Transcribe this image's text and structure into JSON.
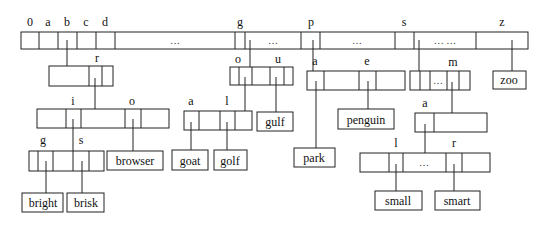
{
  "root": {
    "labels": [
      "0",
      "a",
      "b",
      "c",
      "d",
      "g",
      "p",
      "s",
      "z"
    ],
    "ellipses": [
      "…",
      "…",
      "…",
      "… …"
    ]
  },
  "node_b": {
    "labels": [
      "r"
    ]
  },
  "node_br": {
    "labels": [
      "i",
      "o"
    ]
  },
  "node_bri": {
    "labels": [
      "g",
      "s"
    ]
  },
  "node_g": {
    "labels": [
      "o",
      "u"
    ]
  },
  "node_go": {
    "labels": [
      "a",
      "l"
    ]
  },
  "node_p": {
    "labels": [
      "a",
      "e"
    ]
  },
  "node_s": {
    "labels": [
      "m"
    ],
    "ellipsis": "…"
  },
  "node_sm": {
    "labels": [
      "a"
    ]
  },
  "node_sma": {
    "labels": [
      "l",
      "r"
    ],
    "ellipsis": "…"
  },
  "leaves": {
    "bright": "bright",
    "brisk": "brisk",
    "browser": "browser",
    "goat": "goat",
    "golf": "golf",
    "gulf": "gulf",
    "park": "park",
    "penguin": "penguin",
    "small": "small",
    "smart": "smart",
    "zoo": "zoo"
  }
}
